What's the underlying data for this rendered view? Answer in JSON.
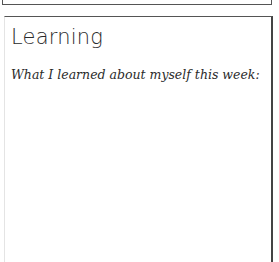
{
  "card": {
    "title": "Learning",
    "prompt": "What I learned about myself this week:",
    "response": ""
  },
  "colors": {
    "border": "#555555",
    "text": "#2a2a2a",
    "background": "#ffffff"
  }
}
